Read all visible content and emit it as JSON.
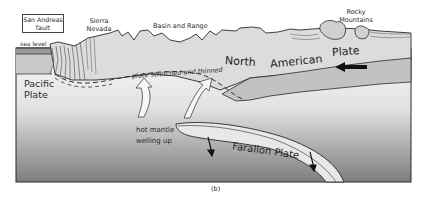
{
  "figure": {
    "caption": "(b)",
    "labels": {
      "san_andreas_fault": "San Andreas fault",
      "sierra_nevada": "Sierra Nevada",
      "basin_and_range": "Basin and Range",
      "rocky_mountains": "Rocky Mountains",
      "sea_level": "sea level",
      "pacific_plate": "Pacific Plate",
      "north_american_plate": [
        "North",
        "American",
        "Plate"
      ],
      "plate_stretched": "plate stretched and thinned",
      "hot_mantle": "hot mantle",
      "welling_up": "welling up",
      "farallon_plate": "Farallon Plate"
    },
    "colors": {
      "surface_crust": "#d9d9d9",
      "lithosphere_band": "#bdbdbd",
      "mantle_top": "#f4f4f4",
      "mantle_bottom": "#7a7a7a",
      "outline": "#2a2a2a"
    }
  }
}
